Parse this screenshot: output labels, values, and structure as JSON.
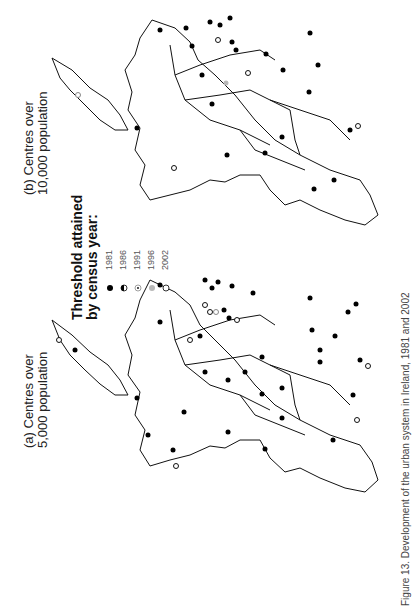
{
  "figure": {
    "caption": "Figure 13. Development of the urban system in Ireland, 1981 and 2002",
    "panels": [
      {
        "id": "a",
        "label_line1": "(a) Centres over",
        "label_line2": "5,000 population"
      },
      {
        "id": "b",
        "label_line1": "(b) Centres over",
        "label_line2": "10,000 population"
      }
    ]
  },
  "legend": {
    "title_line1": "Threshold attained",
    "title_line2": "by census year:",
    "items": [
      {
        "year": "1981",
        "symbol": "filled-black-circle"
      },
      {
        "year": "1986",
        "symbol": "half-filled-circle"
      },
      {
        "year": "1991",
        "symbol": "dotted-circle"
      },
      {
        "year": "1996",
        "symbol": "grey-filled-circle"
      },
      {
        "year": "2002",
        "symbol": "open-circle"
      }
    ]
  },
  "colors": {
    "line": "#111111",
    "filled": "#000000",
    "grey": "#b8b8b8",
    "background": "#ffffff"
  }
}
